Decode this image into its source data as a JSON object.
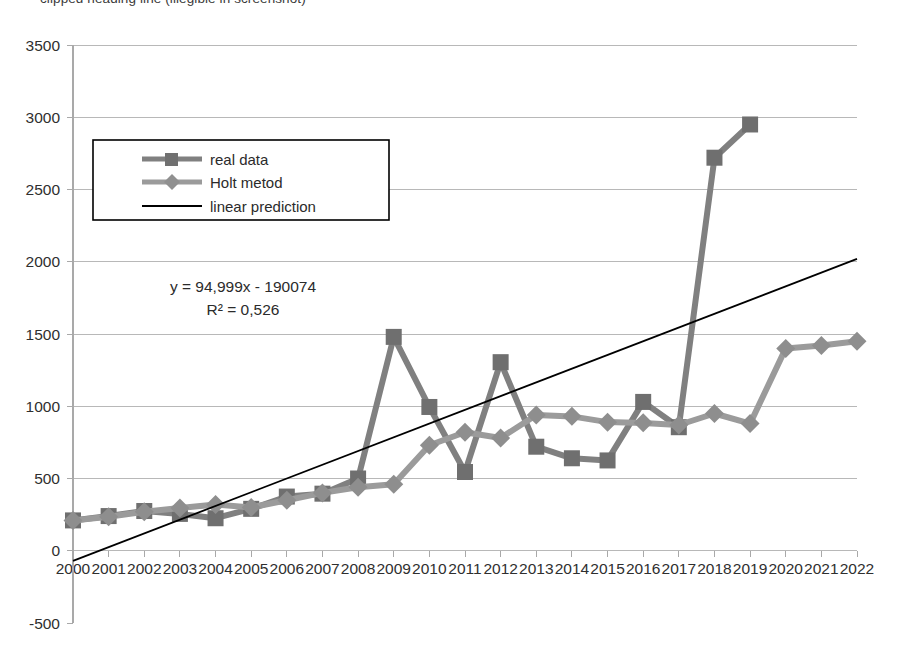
{
  "caption": {
    "text": "clipped heading line (illegible in screenshot)"
  },
  "chart_data": {
    "type": "line",
    "title": "",
    "xlabel": "",
    "ylabel": "",
    "ylim": [
      -500,
      3500
    ],
    "yticks": [
      3500,
      3000,
      2500,
      2000,
      1500,
      1000,
      500,
      0,
      -500
    ],
    "ytick_labels": [
      "3500",
      "3000",
      "2500",
      "2000",
      "1500",
      "1000",
      "500",
      "0",
      "-500"
    ],
    "grid": true,
    "legend_position": "upper-left",
    "categories": [
      "2000",
      "2001",
      "2002",
      "2003",
      "2004",
      "2005",
      "2006",
      "2007",
      "2008",
      "2009",
      "2010",
      "2011",
      "2012",
      "2013",
      "2014",
      "2015",
      "2016",
      "2017",
      "2018",
      "2019",
      "2020",
      "2021",
      "2022"
    ],
    "x": [
      2000,
      2001,
      2002,
      2003,
      2004,
      2005,
      2006,
      2007,
      2008,
      2009,
      2010,
      2011,
      2012,
      2013,
      2014,
      2015,
      2016,
      2017,
      2018,
      2019,
      2020,
      2021,
      2022
    ],
    "series": [
      {
        "name": "real data",
        "color": "#808080",
        "marker": "square",
        "values": [
          210,
          240,
          275,
          255,
          225,
          290,
          375,
          395,
          500,
          1480,
          995,
          545,
          1305,
          720,
          640,
          625,
          1030,
          855,
          2720,
          2950,
          null,
          null,
          null
        ]
      },
      {
        "name": "Holt metod",
        "color": "#9b9b9b",
        "marker": "diamond",
        "values": [
          210,
          235,
          270,
          295,
          320,
          300,
          350,
          400,
          440,
          460,
          730,
          820,
          780,
          940,
          930,
          890,
          885,
          870,
          950,
          880,
          1400,
          1420,
          1450
        ]
      },
      {
        "name": "linear prediction",
        "color": "#000000",
        "marker": "none",
        "type": "trendline",
        "values": [
          -70,
          25,
          120,
          215,
          310,
          405,
          500,
          595,
          690,
          785,
          880,
          975,
          1070,
          1165,
          1260,
          1355,
          1450,
          1545,
          1640,
          1735,
          1830,
          1925,
          2020
        ]
      }
    ],
    "annotations": [
      {
        "name": "regression-equation",
        "text": "y = 94,999x - 190074"
      },
      {
        "name": "r-squared",
        "text": "R² = 0,526"
      }
    ]
  },
  "legend": {
    "items": [
      {
        "label": "real data"
      },
      {
        "label": "Holt metod"
      },
      {
        "label": "linear prediction"
      }
    ]
  }
}
